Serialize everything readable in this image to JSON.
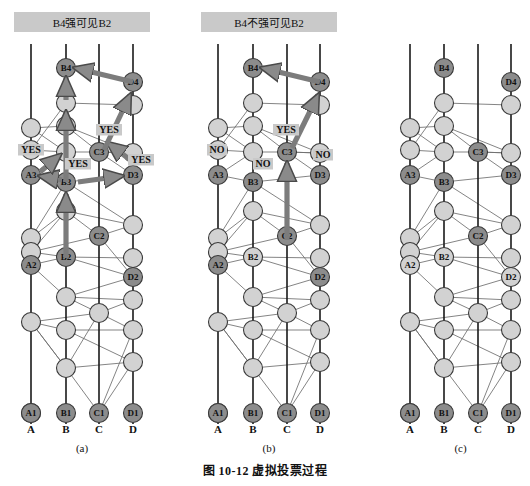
{
  "figure": {
    "caption": "图 10-12    虚拟投票过程",
    "caption_number": "图 10-12",
    "caption_title": "虚拟投票过程"
  },
  "colors": {
    "dark_node": "#8c8c8c",
    "light_node": "#d2d2d2",
    "node_stroke": "#3a3a3a",
    "timeline": "#1a1a1a",
    "edge": "#6e6e6e",
    "arrow": "#7c7c7c",
    "arrow_stroke": "#4a4a4a",
    "banner_bg": "#c9c9c9",
    "label_bg": "#c9c9c9",
    "text": "#111111"
  },
  "panels": [
    {
      "id": "a",
      "label": "(a)",
      "banner": "B4强可见B2",
      "has_banner": true,
      "columns": [
        {
          "name": "A",
          "x": 31
        },
        {
          "name": "B",
          "x": 66
        },
        {
          "name": "C",
          "x": 99
        },
        {
          "name": "D",
          "x": 133
        }
      ],
      "vote_labels": [
        {
          "text": "YES",
          "x": 18,
          "y": 153
        },
        {
          "text": "YES",
          "x": 65,
          "y": 167
        },
        {
          "text": "YES",
          "x": 96,
          "y": 133
        },
        {
          "text": "YES",
          "x": 128,
          "y": 163
        }
      ],
      "named_nodes": [
        {
          "id": "A1",
          "col": 0,
          "y": 413,
          "shade": "dark"
        },
        {
          "id": "B1",
          "col": 1,
          "y": 413,
          "shade": "dark"
        },
        {
          "id": "C1",
          "col": 2,
          "y": 413,
          "shade": "dark"
        },
        {
          "id": "D1",
          "col": 3,
          "y": 413,
          "shade": "dark"
        },
        {
          "id": "A2",
          "col": 0,
          "y": 265,
          "shade": "dark"
        },
        {
          "id": "B2",
          "col": 1,
          "y": 257,
          "shade": "dark"
        },
        {
          "id": "C2",
          "col": 2,
          "y": 236,
          "shade": "dark"
        },
        {
          "id": "D2",
          "col": 3,
          "y": 277,
          "shade": "dark"
        },
        {
          "id": "A3",
          "col": 0,
          "y": 175,
          "shade": "dark"
        },
        {
          "id": "B3",
          "col": 1,
          "y": 182,
          "shade": "dark"
        },
        {
          "id": "C3",
          "col": 2,
          "y": 152,
          "shade": "dark"
        },
        {
          "id": "D3",
          "col": 3,
          "y": 175,
          "shade": "dark"
        },
        {
          "id": "B4",
          "col": 1,
          "y": 68,
          "shade": "dark"
        },
        {
          "id": "D4",
          "col": 3,
          "y": 82,
          "shade": "dark"
        }
      ]
    },
    {
      "id": "b",
      "label": "(b)",
      "banner": "B4不强可见B2",
      "has_banner": true,
      "columns": [
        {
          "name": "A",
          "x": 218
        },
        {
          "name": "B",
          "x": 253
        },
        {
          "name": "C",
          "x": 287
        },
        {
          "name": "D",
          "x": 320
        }
      ],
      "vote_labels": [
        {
          "text": "NO",
          "x": 207,
          "y": 153
        },
        {
          "text": "NO",
          "x": 253,
          "y": 167
        },
        {
          "text": "YES",
          "x": 273,
          "y": 133
        },
        {
          "text": "NO",
          "x": 313,
          "y": 158
        }
      ],
      "named_nodes": [
        {
          "id": "A1",
          "col": 0,
          "y": 413,
          "shade": "dark"
        },
        {
          "id": "B1",
          "col": 1,
          "y": 413,
          "shade": "dark"
        },
        {
          "id": "C1",
          "col": 2,
          "y": 413,
          "shade": "dark"
        },
        {
          "id": "D1",
          "col": 3,
          "y": 413,
          "shade": "dark"
        },
        {
          "id": "A2",
          "col": 0,
          "y": 265,
          "shade": "dark"
        },
        {
          "id": "B2",
          "col": 1,
          "y": 257,
          "shade": "light"
        },
        {
          "id": "C2",
          "col": 2,
          "y": 236,
          "shade": "dark"
        },
        {
          "id": "D2",
          "col": 3,
          "y": 277,
          "shade": "dark"
        },
        {
          "id": "A3",
          "col": 0,
          "y": 175,
          "shade": "dark"
        },
        {
          "id": "B3",
          "col": 1,
          "y": 182,
          "shade": "dark"
        },
        {
          "id": "C3",
          "col": 2,
          "y": 152,
          "shade": "dark"
        },
        {
          "id": "D3",
          "col": 3,
          "y": 175,
          "shade": "dark"
        },
        {
          "id": "B4",
          "col": 1,
          "y": 68,
          "shade": "dark"
        },
        {
          "id": "D4",
          "col": 3,
          "y": 82,
          "shade": "dark"
        }
      ]
    },
    {
      "id": "c",
      "label": "(c)",
      "banner": "",
      "has_banner": false,
      "columns": [
        {
          "name": "A",
          "x": 410
        },
        {
          "name": "B",
          "x": 444
        },
        {
          "name": "C",
          "x": 478
        },
        {
          "name": "D",
          "x": 511
        }
      ],
      "vote_labels": [],
      "named_nodes": [
        {
          "id": "A1",
          "col": 0,
          "y": 413,
          "shade": "dark"
        },
        {
          "id": "B1",
          "col": 1,
          "y": 413,
          "shade": "dark"
        },
        {
          "id": "C1",
          "col": 2,
          "y": 413,
          "shade": "dark"
        },
        {
          "id": "D1",
          "col": 3,
          "y": 413,
          "shade": "dark"
        },
        {
          "id": "A2",
          "col": 0,
          "y": 265,
          "shade": "light"
        },
        {
          "id": "B2",
          "col": 1,
          "y": 257,
          "shade": "light"
        },
        {
          "id": "C2",
          "col": 2,
          "y": 236,
          "shade": "dark"
        },
        {
          "id": "D2",
          "col": 3,
          "y": 277,
          "shade": "light"
        },
        {
          "id": "A3",
          "col": 0,
          "y": 175,
          "shade": "dark"
        },
        {
          "id": "B3",
          "col": 1,
          "y": 182,
          "shade": "dark"
        },
        {
          "id": "C3",
          "col": 2,
          "y": 152,
          "shade": "dark"
        },
        {
          "id": "D3",
          "col": 3,
          "y": 175,
          "shade": "dark"
        },
        {
          "id": "B4",
          "col": 1,
          "y": 68,
          "shade": "dark"
        },
        {
          "id": "D4",
          "col": 3,
          "y": 82,
          "shade": "dark"
        }
      ]
    }
  ],
  "geometry": {
    "timeline_top": 44,
    "timeline_bottom": 424,
    "node_r": 9.5,
    "axis_label_y": 433,
    "panel_label_y": 452,
    "banner": {
      "top": 12,
      "height": 20
    },
    "unnamed_rows": [
      {
        "col": 0,
        "y": 128
      },
      {
        "col": 0,
        "y": 150
      },
      {
        "col": 0,
        "y": 238
      },
      {
        "col": 0,
        "y": 252
      },
      {
        "col": 0,
        "y": 322
      },
      {
        "col": 0,
        "y": 413
      },
      {
        "col": 1,
        "y": 103
      },
      {
        "col": 1,
        "y": 126
      },
      {
        "col": 1,
        "y": 152
      },
      {
        "col": 1,
        "y": 211
      },
      {
        "col": 1,
        "y": 297
      },
      {
        "col": 1,
        "y": 330
      },
      {
        "col": 1,
        "y": 368
      },
      {
        "col": 2,
        "y": 313
      },
      {
        "col": 3,
        "y": 105
      },
      {
        "col": 3,
        "y": 153
      },
      {
        "col": 3,
        "y": 225
      },
      {
        "col": 3,
        "y": 258
      },
      {
        "col": 3,
        "y": 300
      },
      {
        "col": 3,
        "y": 330
      },
      {
        "col": 3,
        "y": 362
      }
    ]
  },
  "arrows": {
    "a": [
      {
        "from": [
          133,
          82
        ],
        "to": [
          75,
          68
        ],
        "name": "d4-to-b4"
      },
      {
        "from": [
          66,
          100
        ],
        "to": [
          66,
          78
        ],
        "name": "b3-chain-to-b4"
      },
      {
        "from": [
          66,
          182
        ],
        "to": [
          66,
          112
        ],
        "name": "b2-to-b3-up"
      },
      {
        "from": [
          66,
          258
        ],
        "to": [
          66,
          194
        ],
        "name": "b2-up"
      },
      {
        "from": [
          62,
          180
        ],
        "to": [
          40,
          176
        ],
        "name": "b3-to-a3"
      },
      {
        "from": [
          40,
          172
        ],
        "to": [
          60,
          155
        ],
        "name": "a3-to-b-node"
      },
      {
        "from": [
          78,
          182
        ],
        "to": [
          122,
          176
        ],
        "name": "b3-to-d3"
      },
      {
        "from": [
          133,
          162
        ],
        "to": [
          108,
          143
        ],
        "name": "d3-to-c3-yes"
      },
      {
        "from": [
          104,
          150
        ],
        "to": [
          130,
          95
        ],
        "name": "c3-to-d4"
      }
    ],
    "b": [
      {
        "from": [
          320,
          82
        ],
        "to": [
          262,
          68
        ],
        "name": "d4-to-b4"
      },
      {
        "from": [
          287,
          240
        ],
        "to": [
          287,
          163
        ],
        "name": "c2-to-c3-up"
      },
      {
        "from": [
          292,
          148
        ],
        "to": [
          318,
          95
        ],
        "name": "c3-to-d4"
      }
    ],
    "c": []
  }
}
